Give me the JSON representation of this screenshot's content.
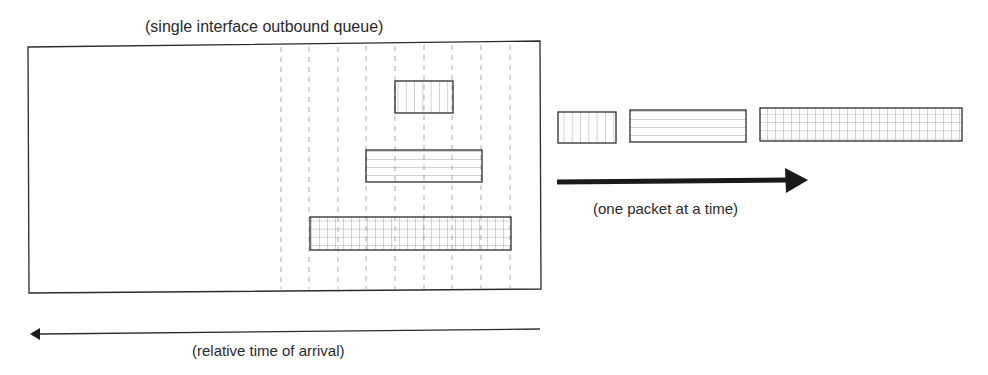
{
  "diagram": {
    "queue_title": "(single interface outbound queue)",
    "output_label": "(one packet at a time)",
    "arrival_label": "(relative time of arrival)",
    "colors": {
      "stroke": "#2b2b2b",
      "fill_lines": "#8a8a8a",
      "dashed": "#9a9a9a",
      "background": "#ffffff"
    },
    "queue_packets": [
      {
        "name": "small-packet",
        "pattern": "vertical-lines",
        "x": 395,
        "y": 81,
        "w": 58,
        "h": 32
      },
      {
        "name": "medium-packet",
        "pattern": "horizontal-lines",
        "x": 366,
        "y": 150,
        "w": 116,
        "h": 32
      },
      {
        "name": "large-packet",
        "pattern": "grid",
        "x": 310,
        "y": 217,
        "w": 201,
        "h": 33
      }
    ],
    "output_packets": [
      {
        "name": "small-packet",
        "pattern": "vertical-lines",
        "x": 558,
        "y": 112,
        "w": 58,
        "h": 31
      },
      {
        "name": "medium-packet",
        "pattern": "horizontal-lines",
        "x": 630,
        "y": 110,
        "w": 116,
        "h": 32
      },
      {
        "name": "large-packet",
        "pattern": "grid",
        "x": 760,
        "y": 108,
        "w": 202,
        "h": 33
      }
    ]
  }
}
